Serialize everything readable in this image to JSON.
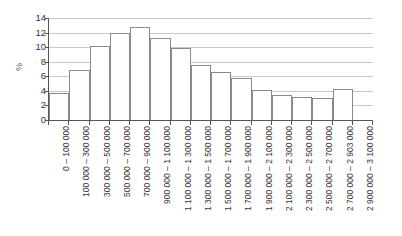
{
  "chart_data": {
    "type": "bar",
    "title": "",
    "xlabel": "",
    "ylabel": "%",
    "ylim": [
      0,
      14
    ],
    "yticks": [
      0,
      2,
      4,
      6,
      8,
      10,
      12,
      14
    ],
    "grid": true,
    "legend": false,
    "categories": [
      "0 – 100 000",
      "100 000 – 300 000",
      "300 000 – 500 000",
      "500 000 – 700 000",
      "700 000 – 900 000",
      "900 000 – 1 100 000",
      "1 100 000 – 1 300 000",
      "1 300 000 – 1 500 000",
      "1 500 000 – 1 700 000",
      "1 700 000 – 1 900 000",
      "1 900 000 – 2 100 000",
      "2 100 000 – 2 300 000",
      "2 300 000 – 2 500 000",
      "2 500 000 – 2 700 000",
      "2 700 000 – 2 903 000",
      "2 900 000 – 3 100 000"
    ],
    "values": [
      3.7,
      6.9,
      10.2,
      12.0,
      12.7,
      11.2,
      9.9,
      7.5,
      6.6,
      5.8,
      4.1,
      3.4,
      3.2,
      3.0,
      4.2,
      0
    ],
    "bar_face_color": "#ffffff",
    "bar_edge_color": "#8a8a8a",
    "grid_color": "#c9c9c9",
    "axis_color": "#555555",
    "background_color": "#ffffff"
  }
}
